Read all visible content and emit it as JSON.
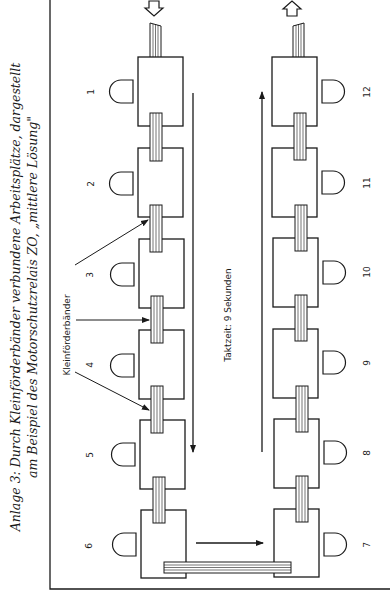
{
  "caption": {
    "line1": "Anlage 3: Durch Kleinförderbänder verbundene Arbeitsplätze, dargestellt",
    "line2": "am Beispiel des Motorschutzrelais ZO, „mittlere Lösung\""
  },
  "labels": {
    "small_conveyors": "Kleinförderbänder",
    "cycle_time": "Taktzeit: 9 Sekunden"
  },
  "stations_left": [
    {
      "number": "1"
    },
    {
      "number": "2"
    },
    {
      "number": "3"
    },
    {
      "number": "4"
    },
    {
      "number": "5"
    },
    {
      "number": "6"
    }
  ],
  "stations_right": [
    {
      "number": "12"
    },
    {
      "number": "11"
    },
    {
      "number": "10"
    },
    {
      "number": "9"
    },
    {
      "number": "8"
    },
    {
      "number": "7"
    }
  ],
  "flow": {
    "input_arrow": "hollow-arrow-down",
    "output_arrow": "hollow-arrow-up",
    "left_line_direction": "down",
    "right_line_direction": "up",
    "transfer_direction": "right"
  },
  "colors": {
    "ink": "#1a1a1a",
    "paper": "#ffffff"
  }
}
